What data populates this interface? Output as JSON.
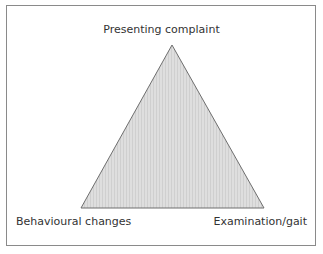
{
  "diagram": {
    "type": "triangle",
    "vertices": {
      "top": "Presenting complaint",
      "bottom_left": "Behavioural changes",
      "bottom_right": "Examination/gait"
    },
    "colors": {
      "fill": "#d9d9d9",
      "stroke": "#6e6e6e",
      "frame": "#8a8a8a",
      "text": "#333333"
    }
  }
}
